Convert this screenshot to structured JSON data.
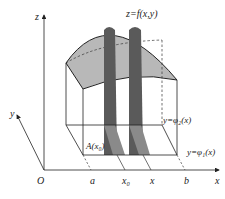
{
  "diagram": {
    "type": "3d-region-under-surface",
    "surface_label": "z=f(x,y)",
    "axes": {
      "z": "z",
      "y": "y",
      "x": "x",
      "origin": "O"
    },
    "x_ticks": [
      "a",
      "x₀",
      "x",
      "b"
    ],
    "boundary_labels": {
      "upper": "y=φ₂(x)",
      "lower": "y=φ₁(x)"
    },
    "cross_section_label": "A(x₀)",
    "colors": {
      "surface_fill": "#b8b8b8",
      "strip_fill": "#5a5a5a",
      "strip_floor_fill": "#8a8a8a",
      "line": "#222222"
    }
  }
}
